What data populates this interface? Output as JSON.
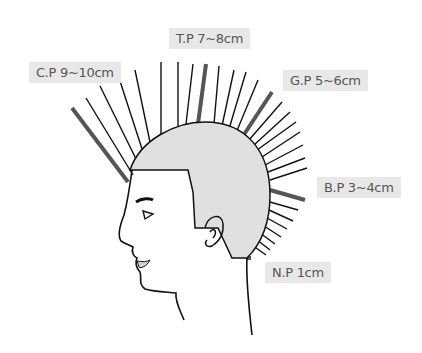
{
  "diagram": {
    "labels": [
      {
        "id": "cp",
        "text": "C.P 9~10cm",
        "point": "C.P",
        "length": "9~10cm"
      },
      {
        "id": "tp",
        "text": "T.P 7~8cm",
        "point": "T.P",
        "length": "7~8cm"
      },
      {
        "id": "gp",
        "text": "G.P 5~6cm",
        "point": "G.P",
        "length": "5~6cm"
      },
      {
        "id": "bp",
        "text": "B.P 3~4cm",
        "point": "B.P",
        "length": "3~4cm"
      },
      {
        "id": "np",
        "text": "N.P 1cm",
        "point": "N.P",
        "length": "1cm"
      }
    ],
    "colors": {
      "label_bg": "#e8e8e8",
      "label_text": "#555555",
      "hair_fill": "#e0e0e0",
      "line": "#111111",
      "guide_line": "#555555"
    }
  }
}
